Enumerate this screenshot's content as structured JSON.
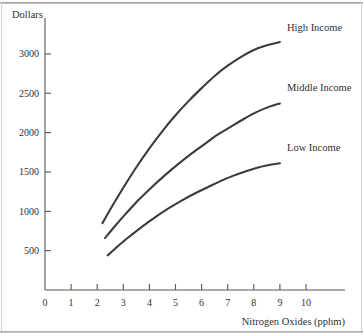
{
  "chart_data": {
    "type": "line",
    "title": "",
    "xlabel": "Nitrogen Oxides (pphm)",
    "ylabel": "Dollars",
    "xlim": [
      0,
      11.5
    ],
    "ylim": [
      0,
      3400
    ],
    "grid": false,
    "legend_position": "inline-right-of-curve-ends",
    "xticks": [
      0,
      1,
      2,
      3,
      4,
      5,
      6,
      7,
      8,
      9,
      10
    ],
    "xtick_labels": [
      "0",
      "1",
      "2",
      "3",
      "4",
      "5",
      "6",
      "7",
      "8",
      "9",
      "10"
    ],
    "yticks": [
      500,
      1000,
      1500,
      2000,
      2500,
      3000
    ],
    "ytick_labels": [
      "500",
      "1000",
      "1500",
      "2000",
      "2500",
      "3000"
    ],
    "series": [
      {
        "name": "High Income",
        "label": "High Income",
        "color": "#3b3c40",
        "x": [
          2.2,
          2.6,
          3.0,
          3.5,
          4.0,
          4.5,
          5.0,
          5.5,
          6.0,
          6.5,
          7.0,
          7.5,
          8.0,
          8.5,
          9.0
        ],
        "values": [
          850,
          1080,
          1300,
          1560,
          1800,
          2020,
          2220,
          2400,
          2565,
          2720,
          2850,
          2960,
          3050,
          3110,
          3150
        ]
      },
      {
        "name": "Middle Income",
        "label": "Middle Income",
        "color": "#3b3c40",
        "x": [
          2.3,
          2.7,
          3.1,
          3.6,
          4.1,
          4.6,
          5.1,
          5.6,
          6.1,
          6.6,
          7.1,
          7.6,
          8.1,
          8.6,
          9.0
        ],
        "values": [
          660,
          820,
          970,
          1150,
          1310,
          1460,
          1600,
          1730,
          1850,
          1970,
          2070,
          2170,
          2260,
          2330,
          2370
        ]
      },
      {
        "name": "Low Income",
        "label": "Low Income",
        "color": "#3b3c40",
        "x": [
          2.4,
          2.8,
          3.2,
          3.7,
          4.2,
          4.7,
          5.2,
          5.7,
          6.2,
          6.7,
          7.2,
          7.7,
          8.2,
          8.7,
          9.0
        ],
        "values": [
          440,
          560,
          670,
          800,
          920,
          1030,
          1130,
          1220,
          1300,
          1380,
          1450,
          1510,
          1560,
          1595,
          1610
        ]
      }
    ]
  },
  "axes": {
    "y_title": "Dollars",
    "x_title": "Nitrogen Oxides (pphm)"
  },
  "colors": {
    "curve": "#3b3c40",
    "axis": "#55565a",
    "text": "#2f3033",
    "background": "#ffffff",
    "frame": "#b4b4b4"
  }
}
